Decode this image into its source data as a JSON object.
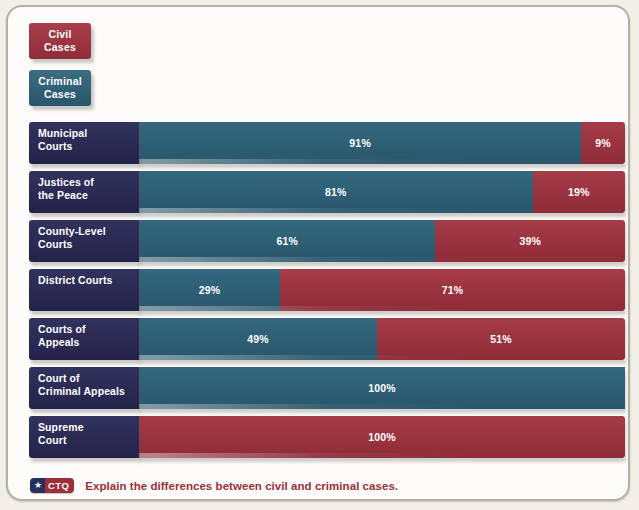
{
  "legend": {
    "items": [
      {
        "label": "Civil\nCases",
        "line1": "Civil",
        "line2": "Cases",
        "color": "#9c3440",
        "key": "civil"
      },
      {
        "label": "Criminal\nCases",
        "line1": "Criminal",
        "line2": "Cases",
        "color": "#2f6076",
        "key": "criminal"
      }
    ]
  },
  "footer": {
    "badge_star": "★",
    "badge_label": "CTQ",
    "question": "Explain the differences between civil and criminal cases."
  },
  "colors": {
    "civil": "#9c3440",
    "criminal": "#2f6076",
    "label_navy": "#2a2a53",
    "frame_border": "#b3b0a6",
    "page_background": "#f2efe8",
    "panel_background": "#fdfcfa",
    "text_on_bar": "#ffffff",
    "ctq_red": "#9c2f37",
    "ctq_navy": "#26305f"
  },
  "chart_data": {
    "type": "bar",
    "orientation": "horizontal",
    "stacked": true,
    "normalized": true,
    "title": "",
    "subtitle": "",
    "xlabel": "",
    "ylabel": "",
    "xlim": [
      0,
      100
    ],
    "grid": false,
    "legend_position": "top-left",
    "value_suffix": "%",
    "categories": [
      "Municipal Courts",
      "Justices of the Peace",
      "County-Level Courts",
      "District Courts",
      "Courts of Appeals",
      "Court of Criminal Appeals",
      "Supreme Court"
    ],
    "series": [
      {
        "name": "Criminal Cases",
        "color": "#2f6076",
        "values": [
          91,
          81,
          61,
          29,
          49,
          100,
          0
        ]
      },
      {
        "name": "Civil Cases",
        "color": "#9c3440",
        "values": [
          9,
          19,
          39,
          71,
          51,
          0,
          100
        ]
      }
    ],
    "rows": [
      {
        "label_line1": "Municipal",
        "label_line2": "Courts",
        "criminal": 91,
        "civil": 9,
        "criminal_label": "91%",
        "civil_label": "9%"
      },
      {
        "label_line1": "Justices of",
        "label_line2": "the Peace",
        "criminal": 81,
        "civil": 19,
        "criminal_label": "81%",
        "civil_label": "19%"
      },
      {
        "label_line1": "County-Level",
        "label_line2": "Courts",
        "criminal": 61,
        "civil": 39,
        "criminal_label": "61%",
        "civil_label": "39%"
      },
      {
        "label_line1": "District Courts",
        "label_line2": "",
        "criminal": 29,
        "civil": 71,
        "criminal_label": "29%",
        "civil_label": "71%"
      },
      {
        "label_line1": "Courts of",
        "label_line2": "Appeals",
        "criminal": 49,
        "civil": 51,
        "criminal_label": "49%",
        "civil_label": "51%"
      },
      {
        "label_line1": "Court of",
        "label_line2": "Criminal Appeals",
        "criminal": 100,
        "civil": 0,
        "criminal_label": "100%",
        "civil_label": ""
      },
      {
        "label_line1": "Supreme",
        "label_line2": "Court",
        "criminal": 0,
        "civil": 100,
        "criminal_label": "",
        "civil_label": "100%"
      }
    ]
  }
}
